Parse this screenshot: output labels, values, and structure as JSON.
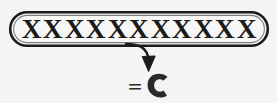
{
  "figure": {
    "background_color": "#f4f4f2",
    "ink_color": "#1b1b1b"
  },
  "capsule": {
    "name": "rounded-capsule-outline",
    "shape": "pill",
    "stroke_color": "#1b1b1b",
    "fill_color": "#f7f7f5",
    "contents_label": "XXXXXXXXXXX",
    "x_count": 11,
    "x_symbol": "X"
  },
  "arrow": {
    "name": "curved-down-arrow",
    "direction": "down",
    "style": "curved-with-solid-head",
    "color": "#1b1b1b"
  },
  "result": {
    "equals": "=",
    "glyph": "C",
    "glyph_description": "bold-crescent-c",
    "color": "#2a2a2a"
  }
}
